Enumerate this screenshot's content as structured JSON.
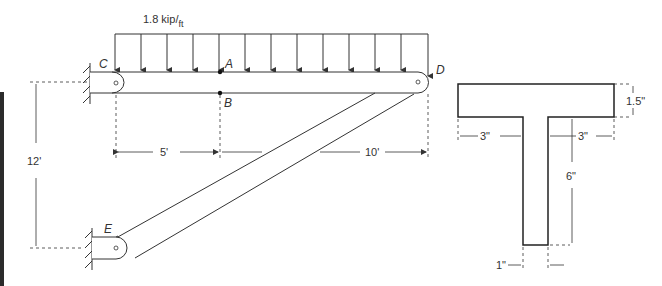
{
  "figure": {
    "load": {
      "label_main": "1.8 kip/",
      "label_sub": "ft",
      "arrow_count": 13
    },
    "points": {
      "A": "A",
      "B": "B",
      "C": "C",
      "D": "D",
      "E": "E"
    },
    "beam_dimensions": {
      "left_span": "5'",
      "right_span": "10'",
      "height": "12'"
    },
    "section": {
      "flange_thickness": "1.5\"",
      "left_overhang": "3\"",
      "right_overhang": "3\"",
      "web_height": "6\"",
      "web_width": "1\""
    }
  },
  "colors": {
    "line": "#333333",
    "edge_bar": "#2b2b2b",
    "background": "#ffffff"
  }
}
